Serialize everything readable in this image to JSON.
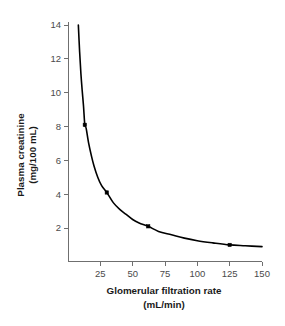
{
  "chart_data": {
    "type": "line",
    "title": "",
    "xlabel": "Glomerular filtration rate (mL/min)",
    "ylabel": "Plasma creatinine (mg/100 mL)",
    "xlabel_line1": "Glomerular filtration rate",
    "xlabel_line2": "(mL/min)",
    "ylabel_line1": "Plasma creatinine",
    "ylabel_line2": "(mg/100 mL)",
    "xlim": [
      0,
      150
    ],
    "ylim": [
      0,
      14
    ],
    "xticks": [
      25,
      50,
      75,
      100,
      125,
      150
    ],
    "xtick_labels": [
      "25",
      "50",
      "75",
      "100",
      "125",
      "150"
    ],
    "yticks": [
      2,
      4,
      6,
      8,
      10,
      12,
      14
    ],
    "ytick_labels": [
      "2",
      "4",
      "6",
      "8",
      "10",
      "12",
      "14"
    ],
    "grid": false,
    "legend": false,
    "curve_color": "#000000",
    "axis_color": "#6f6f6f",
    "series": [
      {
        "name": "Plasma creatinine vs GFR",
        "relationship": "inverse hyperbolic",
        "marked_points": [
          {
            "x": 13,
            "y": 8.1
          },
          {
            "x": 30,
            "y": 4.1
          },
          {
            "x": 62,
            "y": 2.1
          },
          {
            "x": 125,
            "y": 1.0
          }
        ],
        "curve_points": [
          {
            "x": 8,
            "y": 14.0
          },
          {
            "x": 9,
            "y": 12.4
          },
          {
            "x": 10,
            "y": 11.1
          },
          {
            "x": 11,
            "y": 10.1
          },
          {
            "x": 12,
            "y": 9.2
          },
          {
            "x": 13,
            "y": 8.1
          },
          {
            "x": 14,
            "y": 7.9
          },
          {
            "x": 16,
            "y": 7.0
          },
          {
            "x": 18,
            "y": 6.3
          },
          {
            "x": 20,
            "y": 5.7
          },
          {
            "x": 23,
            "y": 5.0
          },
          {
            "x": 26,
            "y": 4.5
          },
          {
            "x": 30,
            "y": 4.1
          },
          {
            "x": 35,
            "y": 3.5
          },
          {
            "x": 40,
            "y": 3.1
          },
          {
            "x": 45,
            "y": 2.8
          },
          {
            "x": 50,
            "y": 2.5
          },
          {
            "x": 55,
            "y": 2.3
          },
          {
            "x": 62,
            "y": 2.1
          },
          {
            "x": 70,
            "y": 1.8
          },
          {
            "x": 80,
            "y": 1.6
          },
          {
            "x": 90,
            "y": 1.4
          },
          {
            "x": 100,
            "y": 1.25
          },
          {
            "x": 112,
            "y": 1.12
          },
          {
            "x": 125,
            "y": 1.0
          },
          {
            "x": 137,
            "y": 0.95
          },
          {
            "x": 150,
            "y": 0.9
          }
        ]
      }
    ]
  }
}
